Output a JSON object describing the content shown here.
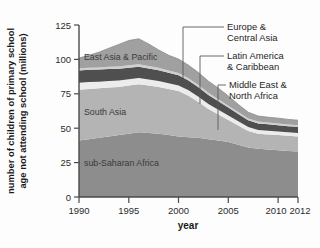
{
  "chart_data": {
    "type": "area",
    "stacked": true,
    "title": "",
    "xlabel": "year",
    "ylabel": "number of children of primary school age not attending school (millions)",
    "ylabel_line1": "number of children of primary school",
    "ylabel_line2": "age not attending school (millions)",
    "xlim": [
      1990,
      2012
    ],
    "ylim": [
      0,
      125
    ],
    "yticks": [
      0,
      25,
      50,
      75,
      100,
      125
    ],
    "ytick_labels": [
      "0",
      "25",
      "50",
      "75",
      "100",
      "125"
    ],
    "xticks": [
      1990,
      1995,
      2000,
      2005,
      2010,
      2012
    ],
    "xtick_labels": [
      "1990",
      "1995",
      "2000",
      "2005",
      "2010",
      "2012"
    ],
    "grid": false,
    "legend_position": "in-plot-annotations",
    "x": [
      1990,
      1991,
      1992,
      1993,
      1994,
      1995,
      1996,
      1997,
      1998,
      1999,
      2000,
      2001,
      2002,
      2003,
      2004,
      2005,
      2006,
      2007,
      2008,
      2009,
      2010,
      2011,
      2012
    ],
    "series": [
      {
        "name": "sub-Saharan Africa",
        "color": "#8d8d8d",
        "label_placement": "inside-band",
        "values": [
          41,
          42,
          43,
          44,
          45,
          46,
          47,
          46.5,
          46,
          45,
          44,
          43.5,
          43,
          42,
          41,
          40,
          38,
          36,
          35,
          34.5,
          34,
          33.5,
          33
        ]
      },
      {
        "name": "South Asia",
        "color": "#b4b4b4",
        "label_placement": "inside-band",
        "values": [
          37,
          36.5,
          36,
          35.5,
          35,
          35,
          35,
          34.5,
          34,
          33.5,
          33,
          30,
          26,
          22,
          19,
          16,
          14,
          12,
          11,
          11,
          11,
          11,
          11
        ]
      },
      {
        "name": "Latin America & Caribbean",
        "color": "#ececec",
        "label_placement": "callout-right",
        "values": [
          5,
          5,
          4.8,
          4.8,
          4.7,
          4.6,
          4.5,
          4.4,
          4.3,
          4.2,
          4.1,
          4,
          3.8,
          3.6,
          3.4,
          3.2,
          3,
          2.8,
          2.7,
          2.6,
          2.6,
          2.5,
          2.5
        ]
      },
      {
        "name": "Middle East & North Africa",
        "color": "#4f4f4f",
        "label_placement": "callout-right",
        "values": [
          9,
          9,
          8.8,
          8.7,
          8.5,
          8.4,
          8.2,
          8,
          7.8,
          7.6,
          7.4,
          7.2,
          7,
          6.6,
          6.2,
          5.8,
          5.4,
          5,
          4.8,
          4.7,
          4.6,
          4.5,
          4.5
        ]
      },
      {
        "name": "Europe & Central Asia",
        "color": "#cfcfcf",
        "label_placement": "callout-right",
        "values": [
          1.5,
          1.5,
          1.6,
          1.6,
          1.7,
          1.7,
          1.8,
          1.8,
          1.8,
          1.7,
          1.7,
          1.6,
          1.6,
          1.5,
          1.5,
          1.4,
          1.4,
          1.3,
          1.3,
          1.3,
          1.3,
          1.2,
          1.2
        ]
      },
      {
        "name": "East Asia & Pacific",
        "color": "#a0a0a0",
        "label_placement": "inside-band",
        "values": [
          7.5,
          9,
          11,
          13.5,
          16,
          18,
          18.5,
          16,
          13,
          11,
          10,
          9.5,
          9,
          8.5,
          8,
          7,
          5.5,
          4.5,
          4,
          3.9,
          3.8,
          3.7,
          3.6
        ]
      }
    ],
    "totals_note": "stacked totals peak near 115 million in 1996 and fall to about 55 million by 2012"
  },
  "annotations": {
    "inband": [
      {
        "name": "east-asia-pacific",
        "text": "East Asia & Pacific"
      },
      {
        "name": "south-asia",
        "text": "South Asia"
      },
      {
        "name": "sub-saharan-africa",
        "text": "sub-Saharan Africa"
      }
    ],
    "callouts": [
      {
        "name": "europe-central-asia",
        "line1": "Europe &",
        "line2": "Central Asia"
      },
      {
        "name": "latin-america-caribbean",
        "line1": "Latin America",
        "line2": "& Caribbean"
      },
      {
        "name": "middle-east-north-africa",
        "line1": "Middle East &",
        "line2": "North Africa"
      }
    ]
  },
  "axes": {
    "x_title": "year",
    "y_title_line1": "number of children of primary school",
    "y_title_line2": "age not attending school (millions)",
    "ytick_labels": [
      "125",
      "100",
      "75",
      "50",
      "25",
      "0"
    ],
    "xtick_labels": [
      "1990",
      "1995",
      "2000",
      "2005",
      "2010",
      "2012"
    ]
  },
  "colors": {
    "axis": "#4a4a4a",
    "text": "#1a1a1a",
    "background": "#fdfdfd",
    "sub_saharan_africa": "#8d8d8d",
    "south_asia": "#b4b4b4",
    "latin_america_caribbean": "#ececec",
    "middle_east_north_africa": "#4f4f4f",
    "europe_central_asia": "#cfcfcf",
    "east_asia_pacific": "#a0a0a0"
  }
}
